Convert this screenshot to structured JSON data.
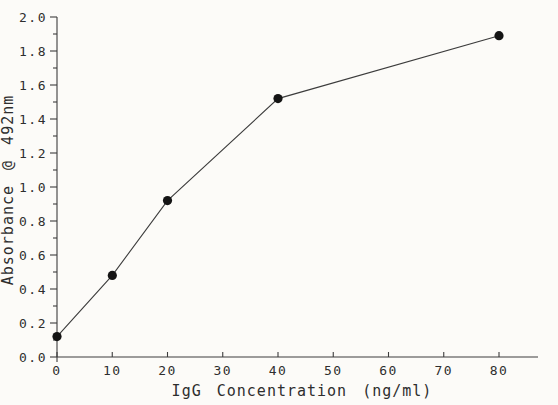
{
  "figure": {
    "background": "#fcfbf8",
    "ink_color": "#3c3c3c",
    "text_color": "#2e2e2e"
  },
  "chart_data": {
    "type": "line",
    "title": "",
    "xlabel": "IgG Concentration (ng/ml)",
    "ylabel": "Absorbance @ 492nm",
    "x": [
      0,
      10,
      20,
      40,
      80
    ],
    "y": [
      0.12,
      0.48,
      0.92,
      1.52,
      1.89
    ],
    "series": [
      {
        "name": "IgG standard curve",
        "points": [
          {
            "x": 0,
            "y": 0.12
          },
          {
            "x": 10,
            "y": 0.48
          },
          {
            "x": 20,
            "y": 0.92
          },
          {
            "x": 40,
            "y": 1.52
          },
          {
            "x": 80,
            "y": 1.89
          }
        ]
      }
    ],
    "xlim": [
      0,
      87
    ],
    "ylim": [
      0,
      2.0
    ],
    "x_ticks": [
      0,
      10,
      20,
      30,
      40,
      50,
      60,
      70,
      80
    ],
    "x_tick_labels": [
      "0",
      "10",
      "20",
      "30",
      "40",
      "50",
      "60",
      "70",
      "80"
    ],
    "y_ticks": [
      0.0,
      0.2,
      0.4,
      0.6,
      0.8,
      1.0,
      1.2,
      1.4,
      1.6,
      1.8,
      2.0
    ],
    "y_tick_labels": [
      "0.0",
      "0.2",
      "0.4",
      "0.6",
      "0.8",
      "1.0",
      "1.2",
      "1.4",
      "1.6",
      "1.8",
      "2.0"
    ],
    "y_minor_tick_step": 0.1,
    "grid": false,
    "legend": null,
    "marker": "filled-circle",
    "marker_color": "#141414",
    "line_color": "#3c3c3c"
  }
}
